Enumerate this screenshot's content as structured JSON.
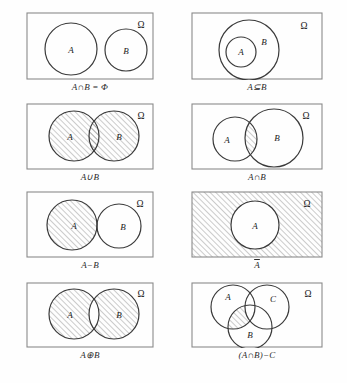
{
  "figure": {
    "universe_label": "Ω",
    "stroke_color": "#3a3a3a",
    "hatch_color": "#6d6d6d",
    "rect_color": "#8a8a8a",
    "background": "#fefefe"
  },
  "panels": [
    {
      "id": "disjoint",
      "caption_parts": {
        "a": "A",
        "op1": "∩",
        "b": "B",
        "op2": "=",
        "c": "Φ"
      },
      "caption": "A∩B = Φ",
      "universe_label": "Ω",
      "set_labels": [
        "A",
        "B"
      ],
      "shaded_region": "none",
      "circles": [
        {
          "label": "A",
          "cx": 45,
          "cy": 37,
          "r": 26
        },
        {
          "label": "B",
          "cx": 100,
          "cy": 38,
          "r": 21
        }
      ]
    },
    {
      "id": "subset",
      "caption_parts": {
        "a": "A",
        "op1": "⊆",
        "b": "B"
      },
      "caption": "A⊆B",
      "universe_label": "Ω",
      "set_labels": [
        "A",
        "B"
      ],
      "shaded_region": "none",
      "circles": [
        {
          "label": "B",
          "cx": 58,
          "cy": 38,
          "r": 30
        },
        {
          "label": "A",
          "cx": 50,
          "cy": 40,
          "r": 15
        }
      ]
    },
    {
      "id": "union",
      "caption_parts": {
        "a": "A",
        "op1": "∪",
        "b": "B"
      },
      "caption": "A∪B",
      "universe_label": "Ω",
      "set_labels": [
        "A",
        "B"
      ],
      "shaded_region": "A union B",
      "circles": [
        {
          "label": "A",
          "cx": 48,
          "cy": 33,
          "r": 25
        },
        {
          "label": "B",
          "cx": 88,
          "cy": 33,
          "r": 25
        }
      ]
    },
    {
      "id": "intersect",
      "caption_parts": {
        "a": "A",
        "op1": "∩",
        "b": "B"
      },
      "caption": "A∩B",
      "universe_label": "Ω",
      "set_labels": [
        "A",
        "B"
      ],
      "shaded_region": "A intersect B",
      "circles": [
        {
          "label": "A",
          "cx": 44,
          "cy": 36,
          "r": 22
        },
        {
          "label": "B",
          "cx": 83,
          "cy": 35,
          "r": 29
        }
      ]
    },
    {
      "id": "difference",
      "caption_parts": {
        "a": "A",
        "op1": "−",
        "b": "B"
      },
      "caption": "A−B",
      "universe_label": "Ω",
      "set_labels": [
        "A",
        "B"
      ],
      "shaded_region": "A minus B",
      "circles": [
        {
          "label": "A",
          "cx": 46,
          "cy": 34,
          "r": 25
        },
        {
          "label": "B",
          "cx": 93,
          "cy": 35,
          "r": 22
        }
      ]
    },
    {
      "id": "complement",
      "caption_parts": {
        "a": "A"
      },
      "caption": "Ā",
      "universe_label": "Ω",
      "set_labels": [
        "A"
      ],
      "shaded_region": "complement of A",
      "circles": [
        {
          "label": "A",
          "cx": 64,
          "cy": 34,
          "r": 24
        }
      ]
    },
    {
      "id": "symdiff",
      "caption_parts": {
        "a": "A",
        "op1": "⊕",
        "b": "B"
      },
      "caption": "A⊕B",
      "universe_label": "Ω",
      "set_labels": [
        "A",
        "B"
      ],
      "shaded_region": "symmetric difference",
      "circles": [
        {
          "label": "A",
          "cx": 48,
          "cy": 32,
          "r": 25
        },
        {
          "label": "B",
          "cx": 88,
          "cy": 32,
          "r": 25
        }
      ]
    },
    {
      "id": "triple",
      "caption_parts": {
        "open": "(",
        "a": "A",
        "op1": "∩",
        "b": "B",
        "close": ")",
        "op2": "−",
        "c": "C"
      },
      "caption": "(A∩B)−C",
      "universe_label": "Ω",
      "set_labels": [
        "A",
        "C",
        "B"
      ],
      "shaded_region": "(A intersect B) minus C",
      "circles": [
        {
          "label": "A",
          "cx": 42,
          "cy": 25,
          "r": 22
        },
        {
          "label": "C",
          "cx": 76,
          "cy": 25,
          "r": 22
        },
        {
          "label": "B",
          "cx": 59,
          "cy": 45,
          "r": 22
        }
      ]
    }
  ]
}
